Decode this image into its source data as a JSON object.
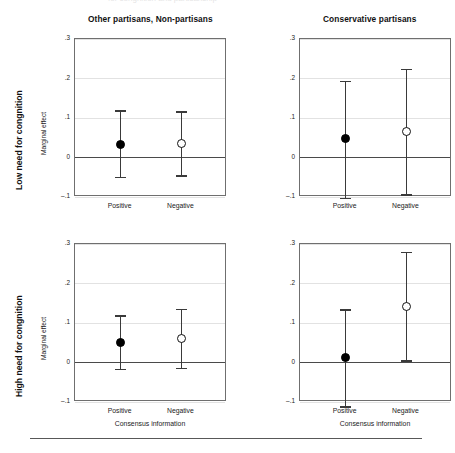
{
  "figure": {
    "partial_top_caption": "for congnition and partisanship",
    "row_labels": [
      "Low need for congnition",
      "High need for congnition"
    ],
    "column_titles": [
      "Other partisans, Non-partisans",
      "Conservative partisans"
    ],
    "y_axis_title": "Marginal effect",
    "x_axis_title": "Consensus information",
    "y_ticks": [
      ".3",
      ".2",
      ".1",
      "0",
      "–.1"
    ],
    "y_tick_values": [
      0.3,
      0.2,
      0.1,
      0,
      -0.1
    ],
    "x_categories": [
      "Positive",
      "Negative"
    ],
    "marker_styles": [
      "filled-circle",
      "open-circle"
    ],
    "colors": {
      "frame": "#6f6f6f",
      "gridline": "#e2e2e2",
      "zeroline": "#4a4a4a",
      "errorbar": "#3a3a3a",
      "marker_filled": "#000000",
      "marker_open": "#ffffff",
      "text": "#1a1a1a",
      "background": "#ffffff"
    }
  },
  "chart_data": {
    "type": "scatter",
    "title": "",
    "xlabel": "Consensus information",
    "ylabel": "Marginal effect",
    "ylim": [
      -0.1,
      0.3
    ],
    "yticks": [
      -0.1,
      0,
      0.1,
      0.2,
      0.3
    ],
    "ytick_labels": [
      "–.1",
      "0",
      ".1",
      ".2",
      ".3"
    ],
    "categories": [
      "Positive",
      "Negative"
    ],
    "grid": true,
    "legend": "none",
    "reference_line": 0,
    "panel_layout": "2x2",
    "row_factor": "Need for cognition",
    "column_factor": "Partisanship",
    "panels": [
      {
        "row": 0,
        "col": 0,
        "row_label": "Low need for congnition",
        "column_title": "Other partisans, Non-partisans",
        "points": [
          {
            "category": "Positive",
            "marker": "filled-circle",
            "estimate": 0.033,
            "ci_low": -0.05,
            "ci_high": 0.118
          },
          {
            "category": "Negative",
            "marker": "open-circle",
            "estimate": 0.035,
            "ci_low": -0.047,
            "ci_high": 0.115
          }
        ]
      },
      {
        "row": 0,
        "col": 1,
        "row_label": "Low need for congnition",
        "column_title": "Conservative partisans",
        "points": [
          {
            "category": "Positive",
            "marker": "filled-circle",
            "estimate": 0.048,
            "ci_low": -0.103,
            "ci_high": 0.192
          },
          {
            "category": "Negative",
            "marker": "open-circle",
            "estimate": 0.067,
            "ci_low": -0.095,
            "ci_high": 0.222
          }
        ]
      },
      {
        "row": 1,
        "col": 0,
        "row_label": "High need for congnition",
        "column_title": "Other partisans, Non-partisans",
        "points": [
          {
            "category": "Positive",
            "marker": "filled-circle",
            "estimate": 0.05,
            "ci_low": -0.018,
            "ci_high": 0.118
          },
          {
            "category": "Negative",
            "marker": "open-circle",
            "estimate": 0.061,
            "ci_low": -0.016,
            "ci_high": 0.135
          }
        ]
      },
      {
        "row": 1,
        "col": 1,
        "row_label": "High need for congnition",
        "column_title": "Conservative partisans",
        "points": [
          {
            "category": "Positive",
            "marker": "filled-circle",
            "estimate": 0.013,
            "ci_low": -0.113,
            "ci_high": 0.133
          },
          {
            "category": "Negative",
            "marker": "open-circle",
            "estimate": 0.143,
            "ci_low": 0.004,
            "ci_high": 0.279
          }
        ]
      }
    ]
  }
}
